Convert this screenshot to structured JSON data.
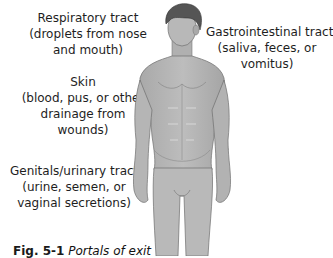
{
  "labels": {
    "respiratory": {
      "title": "Respiratory tract",
      "line2": "(droplets from nose",
      "line3": "and mouth)"
    },
    "skin": {
      "title": "Skin",
      "line2": "(blood, pus, or other",
      "line3": "drainage from",
      "line4": "wounds)"
    },
    "genitals": {
      "title": "Genitals/urinary tract",
      "line2": "(urine, semen, or",
      "line3": "vaginal secretions)"
    },
    "gastrointestinal": {
      "title": "Gastrointestinal tract",
      "line2": "(saliva, feces, or",
      "line3": "vomitus)"
    }
  },
  "caption": {
    "figure_number": "Fig. 5-1",
    "text": "Portals of exit"
  },
  "colors": {
    "skin": "#b8b8b8",
    "skin_shadow": "#9a9a9a",
    "hair": "#555555",
    "outline": "#6e6e6e"
  }
}
